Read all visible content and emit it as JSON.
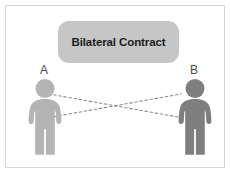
{
  "diagram": {
    "title_pill": {
      "label": "Bilateral Contract",
      "background_color": "#c6c6c6",
      "text_color": "#1c1c1c"
    },
    "parties": [
      {
        "id": "a",
        "label": "A",
        "icon": "person-silhouette-icon",
        "color": "#b4b4b4",
        "side": "left"
      },
      {
        "id": "b",
        "label": "B",
        "icon": "person-silhouette-icon",
        "color": "#7f7f7f",
        "side": "right"
      }
    ],
    "connectors": [
      {
        "id": "obligation-a-to-b",
        "from": "A",
        "to": "B",
        "style": "dashed",
        "color": "#8c8c8c"
      },
      {
        "id": "obligation-b-to-a",
        "from": "B",
        "to": "A",
        "style": "dashed",
        "color": "#8c8c8c"
      }
    ],
    "frame": {
      "background_color": "#ffffff",
      "border_color": "#d8d8d8"
    }
  }
}
